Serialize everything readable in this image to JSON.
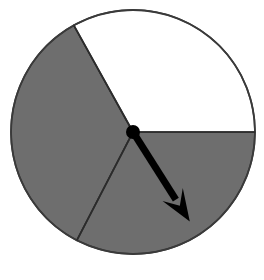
{
  "figure": {
    "kind": "spinner-wheel",
    "background_color": "#ffffff"
  },
  "chart_data": {
    "type": "pie",
    "title": "",
    "subtitle": "",
    "xlabel": "",
    "ylabel": "",
    "legend_position": "none",
    "grid": false,
    "center": {
      "x": 133,
      "y": 132
    },
    "radius": 122,
    "outline_color": "#3a3a3a",
    "outline_width": 1.6,
    "angle_reference": "degrees counterclockwise from 3 o'clock (positive x-axis)",
    "categories": [
      "white-sector",
      "gray-sector-upper-left",
      "gray-sector-lower-right"
    ],
    "values": [
      119,
      123.6,
      117.4
    ],
    "slices": [
      {
        "name": "white-sector",
        "label": "",
        "color": "#ffffff",
        "start_angle_deg": 0,
        "end_angle_deg": 119,
        "sweep_deg": 119,
        "fraction": 0.331
      },
      {
        "name": "gray-sector-upper-left",
        "label": "",
        "color": "#6e6e6e",
        "start_angle_deg": 119,
        "end_angle_deg": 242.6,
        "sweep_deg": 123.6,
        "fraction": 0.343
      },
      {
        "name": "gray-sector-lower-right",
        "label": "",
        "color": "#6e6e6e",
        "start_angle_deg": 242.6,
        "end_angle_deg": 360,
        "sweep_deg": 117.4,
        "fraction": 0.326
      }
    ],
    "divider_lines": [
      {
        "name": "divider-right",
        "angle_deg": 0,
        "endpoint": {
          "x": 255,
          "y": 132
        }
      },
      {
        "name": "divider-upper-left",
        "angle_deg": 119,
        "endpoint": {
          "x": 74,
          "y": 25
        }
      },
      {
        "name": "divider-lower-left",
        "angle_deg": 242.6,
        "endpoint": {
          "x": 77,
          "y": 240
        }
      }
    ],
    "pointer": {
      "name": "spinner-arrow",
      "color": "#000000",
      "angle_deg": -57.6,
      "length": 106,
      "tail": {
        "x": 133,
        "y": 132
      },
      "tip": {
        "x": 190,
        "y": 222
      },
      "shaft_width": 7,
      "hub_radius": 7,
      "arrowhead_length": 32,
      "arrowhead_width": 24
    }
  }
}
